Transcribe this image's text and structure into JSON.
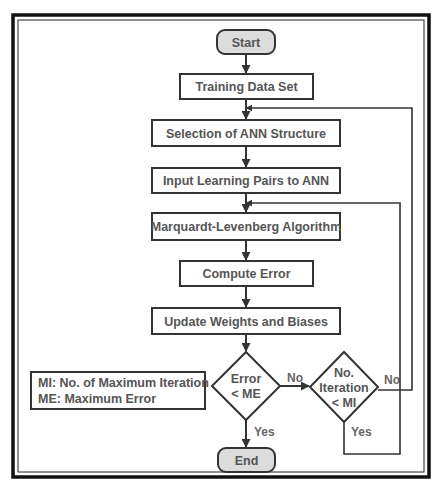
{
  "diagram": {
    "type": "flowchart",
    "colors": {
      "stroke": "#333333",
      "text": "#555555",
      "terminal_fill": "#dcdcdc",
      "background": "#ffffff"
    },
    "nodes": {
      "start": {
        "label": "Start",
        "shape": "terminal"
      },
      "training_data": {
        "label": "Training Data Set",
        "shape": "process"
      },
      "selection": {
        "label": "Selection of ANN Structure",
        "shape": "process"
      },
      "input_pairs": {
        "label": "Input Learning Pairs to ANN",
        "shape": "process"
      },
      "ml_algorithm": {
        "label": "Marquardt-Levenberg Algorithm",
        "shape": "process"
      },
      "compute_error": {
        "label": "Compute Error",
        "shape": "process"
      },
      "update_weights": {
        "label": "Update Weights and Biases",
        "shape": "process"
      },
      "decision_error": {
        "line1": "Error",
        "line2": "< ME",
        "shape": "decision"
      },
      "decision_iter": {
        "line1": "No.",
        "line2": "Iteration",
        "line3": "< MI",
        "shape": "decision"
      },
      "end": {
        "label": "End",
        "shape": "terminal"
      }
    },
    "edges": {
      "error_no": "No",
      "error_yes": "Yes",
      "iter_no": "No",
      "iter_yes": "Yes"
    },
    "legend": {
      "line1": "MI: No. of Maximum Iteration",
      "line2": "ME: Maximum Error"
    }
  }
}
